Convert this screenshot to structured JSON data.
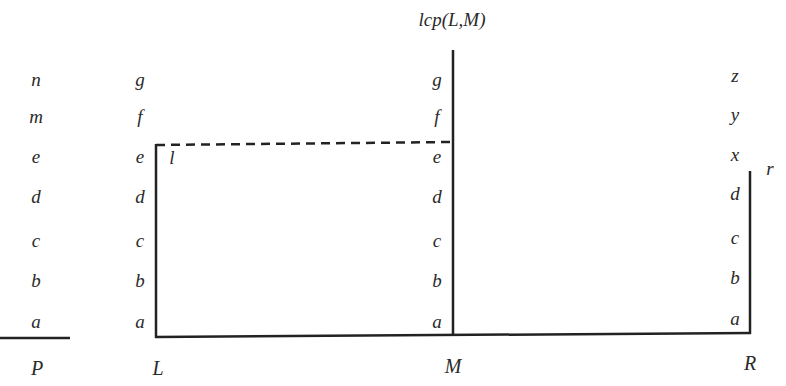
{
  "title": "lcp(L,M)",
  "colors": {
    "line": "#222222",
    "text": "#2a2a2a",
    "background": "#ffffff"
  },
  "columns": [
    {
      "id": "P",
      "name": "P",
      "x": 36,
      "chars": [
        "n",
        "m",
        "e",
        "d",
        "c",
        "b",
        "a"
      ]
    },
    {
      "id": "L",
      "name": "L",
      "x": 140,
      "chars": [
        "g",
        "f",
        "e",
        "d",
        "c",
        "b",
        "a"
      ]
    },
    {
      "id": "M",
      "name": "M",
      "x": 437,
      "chars": [
        "g",
        "f",
        "e",
        "d",
        "c",
        "b",
        "a"
      ]
    },
    {
      "id": "R",
      "name": "R",
      "x": 735,
      "chars": [
        "z",
        "y",
        "x",
        "d",
        "c",
        "b",
        "a"
      ]
    }
  ],
  "row_y": [
    79,
    116,
    156,
    196,
    240,
    280,
    321
  ],
  "annotations": {
    "l_label": "l",
    "r_label": "r"
  },
  "lines": {
    "p_underline": {
      "x1": 0,
      "y1": 338,
      "x2": 70,
      "y2": 338
    },
    "baseline": {
      "x1": 156,
      "y1": 337,
      "x2": 750,
      "y2": 333
    },
    "l_vertical": {
      "x1": 156,
      "y1": 145,
      "x2": 156,
      "y2": 337
    },
    "m_vertical": {
      "x1": 453,
      "y1": 50,
      "x2": 453,
      "y2": 335
    },
    "r_vertical": {
      "x1": 750,
      "y1": 171,
      "x2": 750,
      "y2": 333
    },
    "lcp_dashed": {
      "x1": 156,
      "y1": 145,
      "x2": 453,
      "y2": 142
    }
  }
}
